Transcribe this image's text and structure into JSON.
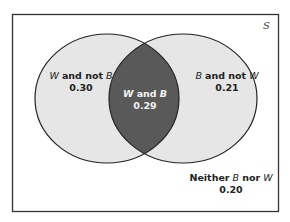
{
  "diagram": {
    "type": "venn",
    "universe_label": "S",
    "regions": [
      {
        "id": "w_not_b",
        "var1": "W",
        "connector": "and not",
        "var2": "B",
        "value": "0.30"
      },
      {
        "id": "w_and_b",
        "var1": "W",
        "connector": "and",
        "var2": "B",
        "value": "0.29"
      },
      {
        "id": "b_not_w",
        "var1": "B",
        "connector": "and not",
        "var2": "W",
        "value": "0.21"
      },
      {
        "id": "neither",
        "prefix": "Neither",
        "var1": "B",
        "connector": "nor",
        "var2": "W",
        "value": "0.20"
      }
    ],
    "colors": {
      "box_border": "#333333",
      "circle_fill": "#e6e6e6",
      "intersection_fill": "#595959",
      "circle_stroke": "#222222"
    }
  }
}
